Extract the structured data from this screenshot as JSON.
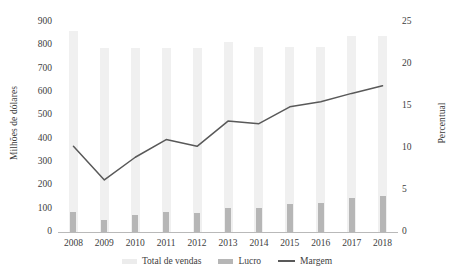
{
  "chart_data": {
    "type": "bar",
    "title": "",
    "subtitle": "",
    "xlabel": "",
    "ylabel": "Milhões de dólares",
    "ylabel_secondary": "Percentual",
    "categories": [
      "2008",
      "2009",
      "2010",
      "2011",
      "2012",
      "2013",
      "2014",
      "2015",
      "2016",
      "2017",
      "2018"
    ],
    "ylim": [
      0,
      900
    ],
    "yticks": [
      0,
      100,
      200,
      300,
      400,
      500,
      600,
      700,
      800,
      900
    ],
    "ylim_secondary": [
      0,
      25
    ],
    "yticks_secondary": [
      0,
      5,
      10,
      15,
      20,
      25
    ],
    "grid": false,
    "legend_position": "bottom",
    "series": [
      {
        "name": "Total de vendas",
        "type": "bar",
        "axis": "left",
        "color": "#f0f0f0",
        "values": [
          860,
          790,
          790,
          790,
          790,
          815,
          795,
          795,
          795,
          840,
          840
        ]
      },
      {
        "name": "Lucro",
        "type": "bar",
        "axis": "left",
        "color": "#b6b6b6",
        "values": [
          85,
          50,
          75,
          85,
          80,
          105,
          105,
          120,
          125,
          145,
          155
        ]
      },
      {
        "name": "Margem",
        "type": "line",
        "axis": "right",
        "color": "#595959",
        "values": [
          10.2,
          6.2,
          8.9,
          11.0,
          10.2,
          13.2,
          12.9,
          14.9,
          15.5,
          16.5,
          17.4
        ]
      }
    ],
    "legend": [
      "Total de vendas",
      "Lucro",
      "Margem"
    ]
  },
  "colors": {
    "sales_bar": "#f0f0f0",
    "profit_bar": "#b6b6b6",
    "margin_line": "#595959",
    "axis": "#b9b9b9",
    "text": "#3d3d3d",
    "background": "#ffffff"
  }
}
